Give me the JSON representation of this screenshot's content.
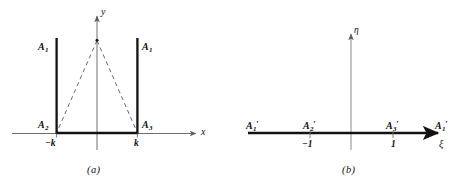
{
  "figure": {
    "kind": "conformal-mapping-diagram",
    "colors": {
      "ink": "#111111",
      "axis": "#6f6f6f",
      "bold_boundary": "#121212",
      "dashed": "#5a5a5a",
      "background": "#ffffff"
    },
    "panels": [
      {
        "id": "a",
        "caption": "(a)",
        "axes": {
          "x_label": "x",
          "y_label": "y"
        },
        "tick_labels": [
          {
            "text": "−k",
            "value": -1
          },
          {
            "text": "k",
            "value": 1
          }
        ],
        "point_labels": [
          {
            "text": "A",
            "sub": "1",
            "prime": "",
            "position": "upper-left-ray"
          },
          {
            "text": "A",
            "sub": "1",
            "prime": "",
            "position": "upper-right-ray"
          },
          {
            "text": "A",
            "sub": "2",
            "prime": "",
            "position": "lower-left-corner"
          },
          {
            "text": "A",
            "sub": "3",
            "prime": "",
            "position": "lower-right-corner"
          }
        ],
        "elements": [
          "vertical-ray-left",
          "vertical-ray-right",
          "base-segment",
          "dashed-triangle"
        ]
      },
      {
        "id": "b",
        "caption": "(b)",
        "axes": {
          "x_label": "ξ",
          "y_label": "η"
        },
        "tick_labels": [
          {
            "text": "−1",
            "value": -1
          },
          {
            "text": "1",
            "value": 1
          }
        ],
        "point_labels": [
          {
            "text": "A",
            "sub": "1",
            "prime": "′",
            "position": "far-left"
          },
          {
            "text": "A",
            "sub": "2",
            "prime": "′",
            "position": "at-minus-one"
          },
          {
            "text": "A",
            "sub": "3",
            "prime": "′",
            "position": "at-plus-one"
          },
          {
            "text": "A",
            "sub": "1",
            "prime": "′",
            "position": "far-right"
          }
        ],
        "elements": [
          "real-axis-bold",
          "eta-axis",
          "tick-minus-one",
          "tick-plus-one"
        ]
      }
    ]
  }
}
